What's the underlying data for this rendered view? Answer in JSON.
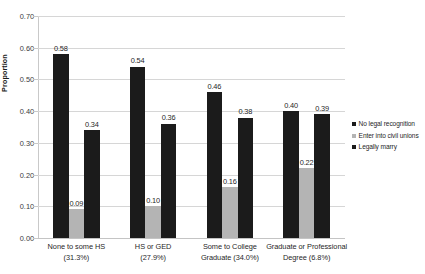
{
  "chart_data": {
    "type": "bar",
    "title": "",
    "xlabel": "",
    "ylabel": "Proportion",
    "ylim": [
      0.0,
      0.7
    ],
    "ytick_labels": [
      "0.00",
      "0.10",
      "0.20",
      "0.30",
      "0.40",
      "0.50",
      "0.60",
      "0.70"
    ],
    "ytick_values": [
      0.0,
      0.1,
      0.2,
      0.3,
      0.4,
      0.5,
      0.6,
      0.7
    ],
    "grid": true,
    "legend_position": "right",
    "categories": [
      "None to some HS (31.3%)",
      "HS or GED (27.9%)",
      "Some to College Graduate (34.0%)",
      "Graduate or Professional Degree (6.8%)"
    ],
    "category_lines": [
      [
        "None to some HS",
        "(31.3%)"
      ],
      [
        "HS or GED",
        "(27.9%)"
      ],
      [
        "Some to College",
        "Graduate (34.0%)"
      ],
      [
        "Graduate or Professional",
        "Degree (6.8%)"
      ]
    ],
    "series": [
      {
        "name": "No legal recognition",
        "color": "#1b1b1b",
        "values": [
          0.58,
          0.54,
          0.46,
          0.4
        ],
        "labels": [
          "0.58",
          "0.54",
          "0.46",
          "0.40"
        ]
      },
      {
        "name": "Enter into civil unions",
        "color": "#b4b4b4",
        "values": [
          0.09,
          0.1,
          0.16,
          0.22
        ],
        "labels": [
          "0.09",
          "0.10",
          "0.16",
          "0.22"
        ]
      },
      {
        "name": "Legally marry",
        "color": "#1b1b1b",
        "values": [
          0.34,
          0.36,
          0.38,
          0.39
        ],
        "labels": [
          "0.34",
          "0.36",
          "0.38",
          "0.39"
        ]
      }
    ]
  },
  "legend": {
    "items": [
      {
        "label": "No legal recognition",
        "swatch": "dark"
      },
      {
        "label": "Enter into civil unions",
        "swatch": "light"
      },
      {
        "label": "Legally marry",
        "swatch": "dark"
      }
    ]
  }
}
